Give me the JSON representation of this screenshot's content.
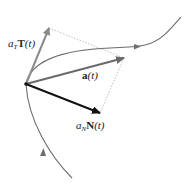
{
  "diagram": {
    "colors": {
      "curve": "#6e6e6e",
      "tangent_vector": "#8a8a8a",
      "acceleration_vector": "#6a6a6a",
      "normal_vector": "#111111",
      "dotted_guides": "#b0b0b0"
    },
    "labels": {
      "tangent": {
        "coef": "a",
        "sub": "T",
        "vec": "T",
        "arg": "(t)"
      },
      "acceleration": {
        "vec": "a",
        "arg": "(t)"
      },
      "normal": {
        "coef": "a",
        "sub": "N",
        "vec": "N",
        "arg": "(t)"
      }
    },
    "points": {
      "base": [
        26,
        84
      ],
      "tangent_tip": [
        49,
        28
      ],
      "acceleration_tip": [
        124,
        58
      ],
      "normal_tip": [
        100,
        113
      ]
    }
  }
}
